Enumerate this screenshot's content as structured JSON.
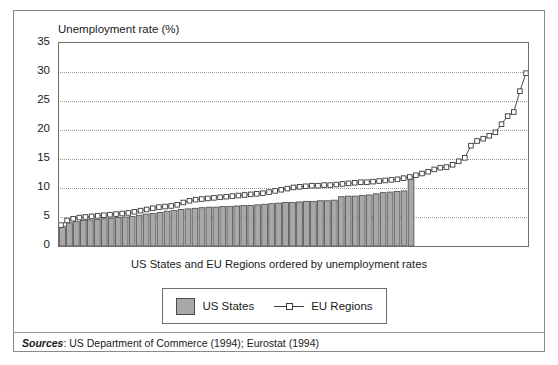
{
  "figure": {
    "title": "Unemployment rate (%)",
    "xlabel": "US States and EU Regions ordered by unemployment rates",
    "sources_label": "Sources",
    "sources_text": ": US Department of Commerce (1994); Eurostat (1994)"
  },
  "legend": {
    "position": "bottom-center",
    "entries": [
      {
        "label": "US States",
        "marker": "filled-square-swatch",
        "color": "#a8a8a8"
      },
      {
        "label": "EU Regions",
        "marker": "line-with-open-square",
        "color": "#3a3a3a"
      }
    ]
  },
  "chart_data": {
    "type": "bar",
    "title": "Unemployment rate (%)",
    "xlabel": "US States and EU Regions ordered by unemployment rates",
    "ylabel": "Unemployment rate (%)",
    "ylim": [
      0,
      35
    ],
    "yticks": [
      0,
      5,
      10,
      15,
      20,
      25,
      30,
      35
    ],
    "ytick_labels": [
      "0",
      "5",
      "10",
      "15",
      "20",
      "25",
      "30",
      "35"
    ],
    "xticks": [],
    "xtick_labels": [],
    "grid": "horizontal-dotted",
    "legend_position": "bottom-center",
    "series": [
      {
        "name": "US States",
        "type": "bar",
        "color": "#a8a8a8",
        "edge_color": "#4a4a4a",
        "count": 51,
        "values": [
          3.4,
          4.0,
          4.2,
          4.4,
          4.5,
          4.6,
          4.7,
          4.8,
          4.9,
          5.0,
          5.1,
          5.3,
          5.5,
          5.6,
          5.8,
          6.0,
          6.1,
          6.3,
          6.4,
          6.5,
          6.6,
          6.7,
          6.7,
          6.8,
          6.8,
          6.9,
          7.0,
          7.0,
          7.1,
          7.2,
          7.3,
          7.4,
          7.5,
          7.5,
          7.6,
          7.7,
          7.7,
          7.8,
          7.8,
          7.9,
          8.5,
          8.6,
          8.6,
          8.7,
          8.8,
          9.0,
          9.2,
          9.3,
          9.4,
          9.5,
          11.7
        ]
      },
      {
        "name": "EU Regions",
        "type": "line",
        "color": "#3a3a3a",
        "marker": "open-square",
        "count": 74,
        "values": [
          3.6,
          4.4,
          4.7,
          4.9,
          5.0,
          5.1,
          5.2,
          5.3,
          5.4,
          5.5,
          5.6,
          5.7,
          5.9,
          6.1,
          6.3,
          6.5,
          6.7,
          6.8,
          6.9,
          7.1,
          7.5,
          7.8,
          8.0,
          8.1,
          8.2,
          8.3,
          8.4,
          8.5,
          8.6,
          8.7,
          8.8,
          8.9,
          9.0,
          9.1,
          9.3,
          9.5,
          9.7,
          9.9,
          10.1,
          10.2,
          10.3,
          10.4,
          10.4,
          10.5,
          10.5,
          10.6,
          10.7,
          10.8,
          10.9,
          11.0,
          11.0,
          11.1,
          11.2,
          11.3,
          11.4,
          11.5,
          11.7,
          11.9,
          12.2,
          12.5,
          12.8,
          13.2,
          13.5,
          13.6,
          14.0,
          14.6,
          15.2,
          17.3,
          18.1,
          18.5,
          19.0,
          19.6,
          21.0,
          22.4,
          23.1,
          26.7,
          29.8
        ]
      }
    ]
  }
}
